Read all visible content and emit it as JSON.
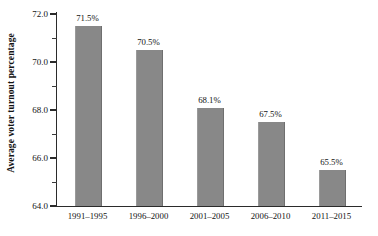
{
  "chart_data": {
    "type": "bar",
    "title": "",
    "subtitle": "",
    "xlabel": "",
    "ylabel": "Average voter turnout percentage",
    "categories": [
      "1991–1995",
      "1996–2000",
      "2001–2005",
      "2006–2010",
      "2011–2015"
    ],
    "values": [
      71.5,
      70.5,
      68.1,
      67.5,
      65.5
    ],
    "data_labels": [
      "71.5%",
      "70.5%",
      "68.1%",
      "67.5%",
      "65.5%"
    ],
    "ylim": [
      64.0,
      72.0
    ],
    "y_major_ticks": [
      64.0,
      66.0,
      68.0,
      70.0,
      72.0
    ],
    "y_tick_labels": [
      "64.0",
      "66.0",
      "68.0",
      "70.0",
      "72.0"
    ],
    "y_minor_ticks": [
      65.0,
      67.0,
      69.0,
      71.0
    ],
    "grid": false,
    "legend": null,
    "bar_color": "#888888",
    "axis_color": "#2b2b2b",
    "background": "#ffffff"
  }
}
